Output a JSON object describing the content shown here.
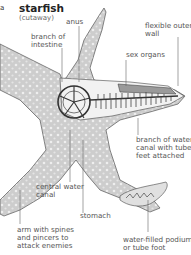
{
  "diagram": {
    "title": "starfish",
    "subtitle": "(cutaway)",
    "corner_mark": "a",
    "colors": {
      "body_fill": "#cfcfcf",
      "body_outline": "#555555",
      "organ_fill": "#e6e6e6",
      "organ_stroke": "#3a3a3a",
      "leader_line": "#666666",
      "label_text": "#555555",
      "background": "#ffffff"
    },
    "labels": [
      {
        "id": "anus",
        "text": "anus"
      },
      {
        "id": "branch-of-intestine",
        "lines": [
          "branch of",
          "intestine"
        ]
      },
      {
        "id": "flexible-outer-wall",
        "lines": [
          "flexible outer",
          "wall"
        ]
      },
      {
        "id": "sex-organs",
        "text": "sex organs"
      },
      {
        "id": "branch-of-water-canal",
        "lines": [
          "branch of water",
          "canal with tube",
          "feet attached"
        ]
      },
      {
        "id": "central-water-canal",
        "lines": [
          "central water",
          "canal"
        ]
      },
      {
        "id": "stomach",
        "text": "stomach"
      },
      {
        "id": "arm-with-spines",
        "lines": [
          "arm with spines",
          "and pincers to",
          "attack enemies"
        ]
      },
      {
        "id": "water-filled-podium",
        "lines": [
          "water-filled podium",
          "or tube foot"
        ]
      }
    ]
  }
}
